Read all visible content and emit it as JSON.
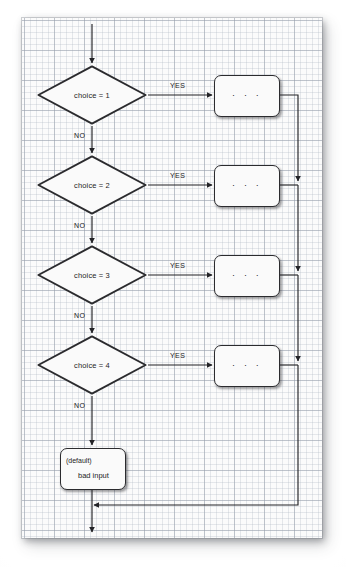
{
  "diagram": {
    "paper": {
      "kind": "graph-paper",
      "grid_minor_px": 6,
      "grid_major_px": 30,
      "sheet_color": "#fbfbfb",
      "grid_color": "#969eaa"
    },
    "colors": {
      "stroke": "#2b2b2e",
      "text": "#1d1d1f",
      "shape_fill": "#fafafa"
    },
    "entry": {
      "name": "entry-arrow",
      "label": ""
    },
    "decisions": [
      {
        "id": "d1",
        "label": "choice = 1",
        "yes_label": "YES",
        "no_label": "NO"
      },
      {
        "id": "d2",
        "label": "choice = 2",
        "yes_label": "YES",
        "no_label": "NO"
      },
      {
        "id": "d3",
        "label": "choice = 3",
        "yes_label": "YES",
        "no_label": "NO"
      },
      {
        "id": "d4",
        "label": "choice = 4",
        "yes_label": "YES",
        "no_label": "NO"
      }
    ],
    "process_boxes": [
      {
        "id": "p1",
        "text": "· · ·"
      },
      {
        "id": "p2",
        "text": "· · ·"
      },
      {
        "id": "p3",
        "text": "· · ·"
      },
      {
        "id": "p4",
        "text": "· · ·"
      }
    ],
    "default_box": {
      "id": "default",
      "line1": "(default)",
      "line2": "bad input"
    },
    "exit": {
      "name": "exit-arrow",
      "label": ""
    }
  }
}
